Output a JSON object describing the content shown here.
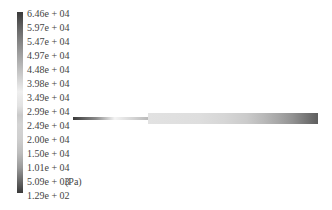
{
  "legend": {
    "unit": "(Pa)",
    "ticks": [
      "6.46e + 04",
      "5.97e + 04",
      "5.47e + 04",
      "4.97e + 04",
      "4.48e + 04",
      "3.98e + 04",
      "3.49e + 04",
      "2.99e + 04",
      "2.49e + 04",
      "2.00e + 04",
      "1.50e + 04",
      "1.01e + 04",
      "5.09e + 03",
      "1.29e + 02"
    ]
  },
  "geometry": {
    "description": "Pressure contour of a pipe: thin inlet section followed by a wider channel"
  }
}
